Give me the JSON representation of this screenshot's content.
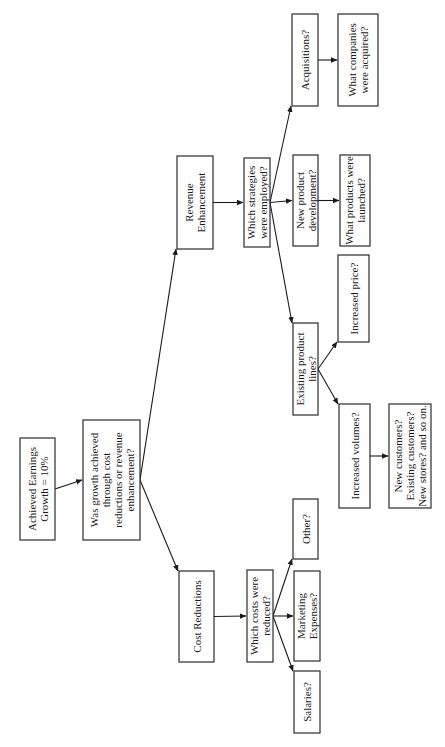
{
  "diagram": {
    "type": "flowchart-tree",
    "orientation": "rotated-90-ccw",
    "nodes": [
      {
        "id": "root",
        "lines": [
          "Achieved Earnings",
          "Growth = 10%"
        ],
        "x": 20,
        "y": 438,
        "w": 35,
        "h": 102
      },
      {
        "id": "q1",
        "lines": [
          "Was growth achieved",
          "through cost",
          "reductions or revenue",
          "enhancement?"
        ],
        "x": 83,
        "y": 420,
        "w": 57,
        "h": 120
      },
      {
        "id": "rev",
        "lines": [
          "Revenue",
          "Enhancement"
        ],
        "x": 177,
        "y": 156,
        "w": 36,
        "h": 93
      },
      {
        "id": "cost",
        "lines": [
          "Cost Reductions"
        ],
        "x": 179,
        "y": 571,
        "w": 35,
        "h": 91
      },
      {
        "id": "strat",
        "lines": [
          "Which strategies",
          "were employed?"
        ],
        "x": 244,
        "y": 158,
        "w": 26,
        "h": 89
      },
      {
        "id": "costs_q",
        "lines": [
          "Which costs were",
          "reduced?"
        ],
        "x": 247,
        "y": 570,
        "w": 26,
        "h": 92
      },
      {
        "id": "acq",
        "lines": [
          "Acquisitions?"
        ],
        "x": 292,
        "y": 14,
        "w": 26,
        "h": 92
      },
      {
        "id": "npd",
        "lines": [
          "New product",
          "development?"
        ],
        "x": 293,
        "y": 155,
        "w": 25,
        "h": 91
      },
      {
        "id": "epl",
        "lines": [
          "Existing product",
          "lines?"
        ],
        "x": 293,
        "y": 323,
        "w": 25,
        "h": 92
      },
      {
        "id": "other",
        "lines": [
          "Other?"
        ],
        "x": 293,
        "y": 499,
        "w": 25,
        "h": 60
      },
      {
        "id": "mkt",
        "lines": [
          "Marketing",
          "Expenses?"
        ],
        "x": 294,
        "y": 571,
        "w": 26,
        "h": 90
      },
      {
        "id": "sal",
        "lines": [
          "Salaries?"
        ],
        "x": 294,
        "y": 671,
        "w": 26,
        "h": 62
      },
      {
        "id": "wca",
        "lines": [
          "What companies",
          "were acquired?"
        ],
        "x": 338,
        "y": 14,
        "w": 40,
        "h": 92
      },
      {
        "id": "wpl",
        "lines": [
          "What products were",
          "launched?"
        ],
        "x": 340,
        "y": 155,
        "w": 30,
        "h": 91
      },
      {
        "id": "price",
        "lines": [
          "Increased price?"
        ],
        "x": 338,
        "y": 255,
        "w": 31,
        "h": 87
      },
      {
        "id": "vol",
        "lines": [
          "Increased volumes?"
        ],
        "x": 339,
        "y": 404,
        "w": 31,
        "h": 104
      },
      {
        "id": "cust",
        "lines": [
          "New customers?",
          "Existing customers?",
          "New stores? and so on."
        ],
        "x": 389,
        "y": 404,
        "w": 42,
        "h": 104
      }
    ],
    "edges": [
      {
        "from": "root",
        "to": "q1"
      },
      {
        "from": "q1",
        "to": "rev"
      },
      {
        "from": "q1",
        "to": "cost"
      },
      {
        "from": "rev",
        "to": "strat"
      },
      {
        "from": "cost",
        "to": "costs_q"
      },
      {
        "from": "strat",
        "to": "acq"
      },
      {
        "from": "strat",
        "to": "npd"
      },
      {
        "from": "strat",
        "to": "epl"
      },
      {
        "from": "costs_q",
        "to": "other"
      },
      {
        "from": "costs_q",
        "to": "mkt"
      },
      {
        "from": "costs_q",
        "to": "sal"
      },
      {
        "from": "acq",
        "to": "wca"
      },
      {
        "from": "npd",
        "to": "wpl"
      },
      {
        "from": "epl",
        "to": "price"
      },
      {
        "from": "epl",
        "to": "vol"
      },
      {
        "from": "vol",
        "to": "cust"
      }
    ],
    "colors": {
      "stroke": "#2a2a2a",
      "text": "#1a1a1a",
      "background": "#ffffff"
    }
  }
}
